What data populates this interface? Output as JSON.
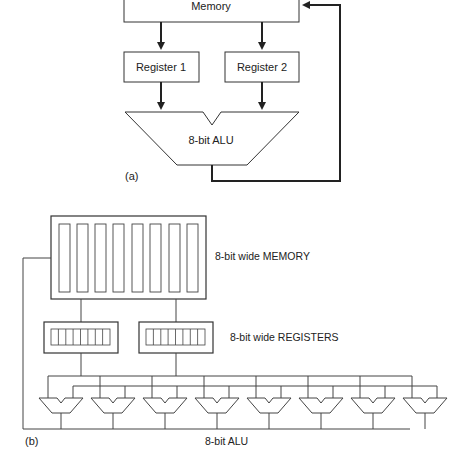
{
  "figure_a": {
    "memory_label": "Memory",
    "register1_label": "Register 1",
    "register2_label": "Register 2",
    "alu_label": "8-bit ALU",
    "caption": "(a)"
  },
  "figure_b": {
    "memory_label": "8-bit wide MEMORY",
    "registers_label": "8-bit wide REGISTERS",
    "alu_label": "8-bit ALU",
    "caption": "(b)",
    "memory_columns": 8,
    "register_cells": 8,
    "alu_count": 8
  },
  "colors": {
    "line": "#333333",
    "text": "#222222",
    "background": "#ffffff"
  }
}
